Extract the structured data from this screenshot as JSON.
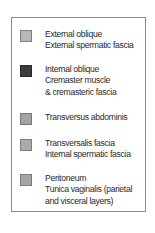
{
  "legend": {
    "items": [
      {
        "lines": [
          "External oblique",
          "External spermatic fascia"
        ],
        "color": "#b8b8b8",
        "border": "#7f7f7f"
      },
      {
        "lines": [
          "Internal oblique",
          "Cremaster muscle",
          "& cremasteric fascia"
        ],
        "color": "#3b3b3b",
        "border": "#2a2a2a"
      },
      {
        "lines": [
          "Transversus abdominis"
        ],
        "color": "#a3a3a3",
        "border": "#7a7a7a"
      },
      {
        "lines": [
          "Transversalis fascia",
          "Internal spermatic fascia"
        ],
        "color": "#ababab",
        "border": "#7d7d7d"
      },
      {
        "lines": [
          "Peritoneum",
          "Tunica vaginalis (parietal",
          "and visceral layers)"
        ],
        "color": "#a6a6a6",
        "border": "#7a7a7a"
      }
    ]
  }
}
